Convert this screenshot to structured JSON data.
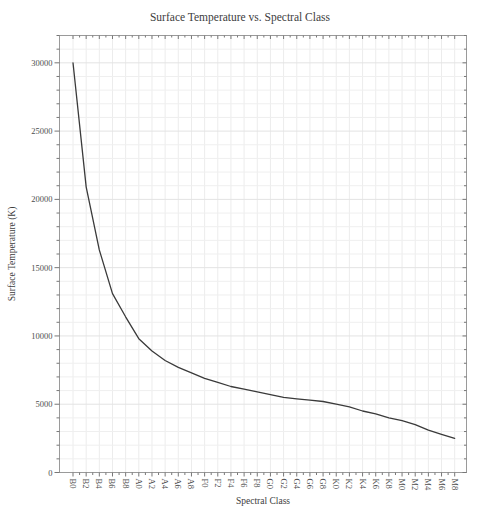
{
  "figure": {
    "title": "Surface Temperature vs. Spectral Class"
  },
  "chart_data": {
    "type": "line",
    "title": "Surface Temperature vs. Spectral Class",
    "xlabel": "Spectral Class",
    "ylabel": "Surface Temperature (K)",
    "categories": [
      "B0",
      "B2",
      "B4",
      "B6",
      "B8",
      "A0",
      "A2",
      "A4",
      "A6",
      "A8",
      "F0",
      "F2",
      "F4",
      "F6",
      "F8",
      "G0",
      "G2",
      "G4",
      "G6",
      "G8",
      "K0",
      "K2",
      "K4",
      "K6",
      "K8",
      "M0",
      "M2",
      "M4",
      "M6",
      "M8"
    ],
    "values": [
      30000,
      20900,
      16300,
      13100,
      11400,
      9800,
      8900,
      8200,
      7700,
      7300,
      6900,
      6600,
      6300,
      6100,
      5900,
      5700,
      5500,
      5400,
      5300,
      5200,
      5000,
      4800,
      4500,
      4300,
      4000,
      3800,
      3500,
      3100,
      2800,
      2500
    ],
    "y_ticks": [
      0,
      5000,
      10000,
      15000,
      20000,
      25000,
      30000
    ],
    "y_minor_step": 1000,
    "ylim": [
      0,
      32000
    ],
    "grid": true,
    "legend": "none",
    "colors": {
      "line": "#3a3a3a",
      "frame": "#9a9a9a",
      "grid_minor": "#efefef",
      "grid_major": "#e3e3e3",
      "grid_vertical": "#ececec",
      "tick": "#777777",
      "text": "#4d4d4d",
      "title": "#3d3d3d"
    }
  }
}
